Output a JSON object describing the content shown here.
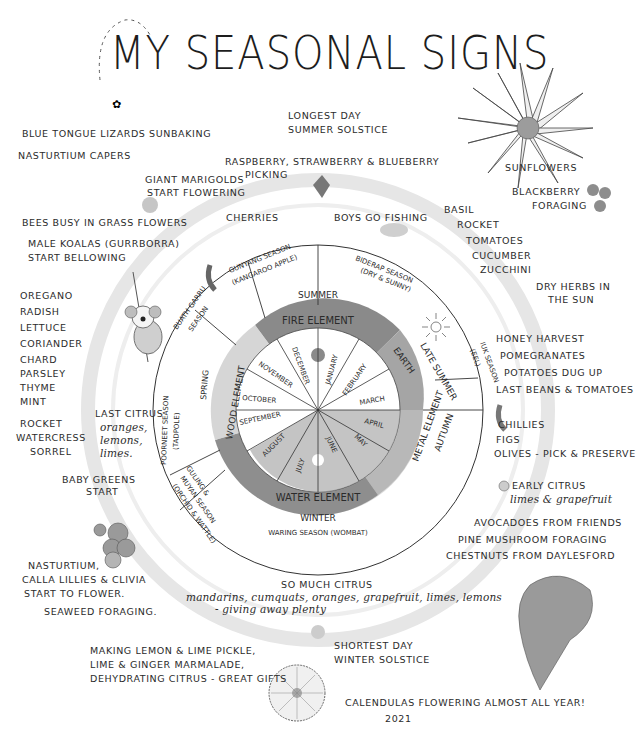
{
  "title": "MY SEASONAL SIGNS",
  "wheel": {
    "seasons": {
      "summer": "SUMMER",
      "late_summer": "LATE SUMMER",
      "autumn": "AUTUMN",
      "winter": "WINTER",
      "spring": "SPRING"
    },
    "elements": {
      "fire": "FIRE ELEMENT",
      "earth": "EARTH",
      "metal": "METAL ELEMENT",
      "water": "WATER ELEMENT",
      "wood": "WOOD ELEMENT"
    },
    "months": [
      "JANUARY",
      "FEBRUARY",
      "MARCH",
      "APRIL",
      "MAY",
      "JUNE",
      "JULY",
      "AUGUST",
      "SEPTEMBER",
      "OCTOBER",
      "NOVEMBER",
      "DECEMBER"
    ],
    "indigenous_seasons": {
      "biderap": "BIDERAP SEASON",
      "biderap_sub": "(DRY & SUNNY)",
      "iuk": "IUK SEASON",
      "iuk_sub": "(EEL)",
      "waring": "WARING SEASON (WOMBAT)",
      "guling": "GULING &",
      "guling_2": "MUYAN SEASON",
      "guling_sub": "(ORCHID & WATTLE)",
      "poorneet": "POORNEET SEASON",
      "poorneet_sub": "(TADPOLE)",
      "buath": "BUATH GARRU",
      "buath_2": "SEASON",
      "garrawang": "GUNYANG SEASON",
      "garrawang_sub": "(KANGAROO APPLE)"
    },
    "colors": {
      "fire": "#8a8a8a",
      "earth": "#a3a3a3",
      "metal": "#b8b8b8",
      "water": "#8e8e8e",
      "wood": "#d2d2d2",
      "ring": "#e4e4e4"
    }
  },
  "notes": {
    "top": {
      "solstice_1": "LONGEST DAY",
      "solstice_2": "SUMMER SOLSTICE",
      "berries_1": "RASPBERRY, STRAWBERRY & BLUEBERRY",
      "berries_2": "PICKING",
      "cherries": "CHERRIES",
      "fishing": "BOYS GO FISHING",
      "marigolds_1": "GIANT MARIGOLDS",
      "marigolds_2": "START FLOWERING"
    },
    "top_left": {
      "lizards": "BLUE TONGUE LIZARDS SUNBAKING",
      "capers": "NASTURTIUM CAPERS",
      "bees": "BEES BUSY IN GRASS FLOWERS",
      "koalas_1": "MALE KOALAS (GURRBORRA)",
      "koalas_2": "START BELLOWING"
    },
    "left_herbs": [
      "OREGANO",
      "RADISH",
      "LETTUCE",
      "CORIANDER",
      "CHARD",
      "PARSLEY",
      "THYME",
      "MINT",
      "ROCKET",
      "WATERCRESS",
      "SORREL"
    ],
    "last_citrus": [
      "LAST CITRUS",
      "oranges,",
      "lemons,",
      "limes."
    ],
    "baby_greens_1": "BABY GREENS",
    "baby_greens_2": "START",
    "bottom_left": {
      "flowers_1": "NASTURTIUM,",
      "flowers_2": "CALLA LILLIES & CLIVIA",
      "flowers_3": "START TO FLOWER.",
      "seaweed": "SEAWEED FORAGING."
    },
    "pickle": [
      "MAKING LEMON & LIME PICKLE,",
      "LIME & GINGER MARMALADE,",
      "DEHYDRATING CITRUS - great gifts"
    ],
    "bottom": {
      "citrus_title": "SO MUCH CITRUS",
      "citrus_list": "mandarins, cumquats, oranges, grapefruit, limes, lemons",
      "citrus_give": "- giving away plenty",
      "solstice_1": "SHORTEST DAY",
      "solstice_2": "WINTER SOLSTICE",
      "calendulas": "CALENDULAS FLOWERING ALMOST ALL YEAR!",
      "signature": "2021"
    },
    "right": {
      "sunflowers": "SUNFLOWERS",
      "blackberry_1": "BLACKBERRY",
      "blackberry_2": "FORAGING",
      "summer_veg": [
        "BASIL",
        "ROCKET",
        "TOMATOES",
        "CUCUMBER",
        "ZUCCHINI"
      ],
      "herbs_1": "DRY HERBS IN",
      "herbs_2": "THE SUN",
      "autumn": [
        "HONEY HARVEST",
        "POMEGRANATES",
        "POTATOES DUG UP",
        "LAST BEANS & TOMATOES"
      ],
      "chillies": "CHILLIES",
      "figs": "FIGS",
      "olives": "OLIVES - pick & preserve",
      "early_citrus_1": "EARLY CITRUS",
      "early_citrus_2": "limes & grapefruit",
      "avocados": "AVOCADOES FROM FRIENDS",
      "pine": "PINE MUSHROOM FORAGING",
      "chestnuts": "CHESTNUTS FROM DAYLESFORD"
    }
  }
}
